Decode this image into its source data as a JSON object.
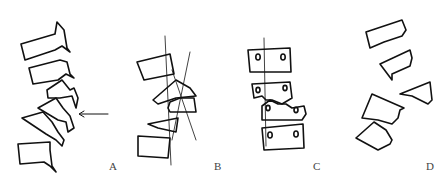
{
  "figure": {
    "panels": [
      {
        "label": "A",
        "description": "lumbar spine lateral view with arrow pointing at vertebra"
      },
      {
        "label": "B",
        "description": "wedged vertebrae with two crossing alignment lines"
      },
      {
        "label": "C",
        "description": "AP view of four vertebrae with pedicle circles and vertical line"
      },
      {
        "label": "D",
        "description": "displaced vertebral fragments"
      }
    ]
  }
}
